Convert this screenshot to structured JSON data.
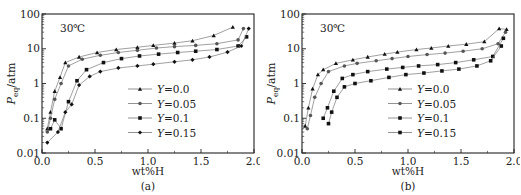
{
  "chart_data": [
    {
      "type": "line",
      "panel_label": "(a)",
      "title": "",
      "annotation": "30℃",
      "xlabel": "wt%H",
      "ylabel": "P_eq/atm",
      "ylabel_main": "P",
      "ylabel_sub": "eq",
      "ylabel_unit": "/atm",
      "yscale": "log",
      "xlim": [
        0.0,
        2.0
      ],
      "ylim": [
        0.01,
        100
      ],
      "xticks": [
        "0.0",
        "0.5",
        "1.0",
        "1.5",
        "2.0"
      ],
      "yticks": [
        "0.01",
        "0.1",
        "1",
        "10",
        "100"
      ],
      "grid": false,
      "legend_position": "center-right",
      "series": [
        {
          "name": "Y=0.0",
          "marker": "triangle",
          "x": [
            0.05,
            0.08,
            0.12,
            0.17,
            0.22,
            0.35,
            0.52,
            0.7,
            0.9,
            1.05,
            1.25,
            1.42,
            1.62,
            1.8
          ],
          "y": [
            0.05,
            0.15,
            0.6,
            1.5,
            4.0,
            5.8,
            7.8,
            9.5,
            11.0,
            12.5,
            14.5,
            17.0,
            24.0,
            42.0
          ]
        },
        {
          "name": "Y=0.05",
          "marker": "circle",
          "x": [
            0.05,
            0.08,
            0.12,
            0.18,
            0.25,
            0.38,
            0.55,
            0.72,
            0.9,
            1.08,
            1.25,
            1.45,
            1.65,
            1.85,
            1.9
          ],
          "y": [
            0.04,
            0.1,
            0.35,
            1.0,
            3.2,
            5.0,
            6.5,
            7.8,
            9.0,
            10.5,
            11.5,
            12.5,
            14.0,
            18.0,
            38.0
          ]
        },
        {
          "name": "Y=0.1",
          "marker": "square",
          "x": [
            0.08,
            0.12,
            0.18,
            0.25,
            0.33,
            0.42,
            0.58,
            0.75,
            0.92,
            1.1,
            1.28,
            1.45,
            1.65,
            1.85,
            1.93
          ],
          "y": [
            0.05,
            0.09,
            0.05,
            0.3,
            1.2,
            2.5,
            4.0,
            5.2,
            6.2,
            7.0,
            7.8,
            8.5,
            9.5,
            12.0,
            22.0
          ]
        },
        {
          "name": "Y=0.15",
          "marker": "diamond",
          "x": [
            0.05,
            0.15,
            0.22,
            0.28,
            0.35,
            0.45,
            0.55,
            0.72,
            0.9,
            1.05,
            1.25,
            1.42,
            1.58,
            1.75,
            1.88,
            1.95
          ],
          "y": [
            0.02,
            0.04,
            0.15,
            0.25,
            0.9,
            1.6,
            2.2,
            2.8,
            3.2,
            3.6,
            4.2,
            4.8,
            5.8,
            8.0,
            12.0,
            38.0
          ]
        }
      ]
    },
    {
      "type": "line",
      "panel_label": "(b)",
      "title": "",
      "annotation": "30℃",
      "xlabel": "wt%H",
      "ylabel": "P_eq/atm",
      "ylabel_main": "P",
      "ylabel_sub": "eq",
      "ylabel_unit": "/atm",
      "yscale": "log",
      "xlim": [
        0.0,
        2.0
      ],
      "ylim": [
        0.01,
        100
      ],
      "xticks": [
        "0.0",
        "0.5",
        "1.0",
        "1.5",
        "2.0"
      ],
      "yticks": [
        "0.01",
        "0.1",
        "1",
        "10",
        "100"
      ],
      "grid": false,
      "legend_position": "center-right",
      "series": [
        {
          "name": "Y=0.0",
          "marker": "triangle",
          "x": [
            0.03,
            0.06,
            0.1,
            0.15,
            0.2,
            0.32,
            0.48,
            0.62,
            0.78,
            0.9,
            1.08,
            1.22,
            1.38,
            1.55,
            1.72,
            1.86,
            1.93
          ],
          "y": [
            0.06,
            0.2,
            0.7,
            1.8,
            2.5,
            3.8,
            4.8,
            5.8,
            7.0,
            8.0,
            9.5,
            10.5,
            12.0,
            13.5,
            16.0,
            38.0,
            36.0
          ]
        },
        {
          "name": "Y=0.05",
          "marker": "circle",
          "x": [
            0.05,
            0.08,
            0.12,
            0.18,
            0.25,
            0.4,
            0.52,
            0.7,
            0.85,
            1.0,
            1.18,
            1.35,
            1.52,
            1.7,
            1.85,
            1.92
          ],
          "y": [
            0.05,
            0.12,
            0.4,
            1.0,
            2.2,
            3.2,
            3.8,
            4.5,
            5.2,
            6.0,
            6.8,
            7.5,
            8.5,
            10.0,
            14.0,
            30.0
          ]
        },
        {
          "name": "Y=0.1",
          "marker": "square",
          "x": [
            0.2,
            0.24,
            0.3,
            0.38,
            0.48,
            0.62,
            0.8,
            0.95,
            1.1,
            1.28,
            1.45,
            1.62,
            1.8,
            1.9
          ],
          "y": [
            0.1,
            0.2,
            0.6,
            1.4,
            1.8,
            2.2,
            2.6,
            2.9,
            3.2,
            3.5,
            4.0,
            4.8,
            6.0,
            20.0
          ]
        },
        {
          "name": "Y=0.15",
          "marker": "square",
          "x": [
            0.25,
            0.28,
            0.33,
            0.4,
            0.5,
            0.65,
            0.82,
            0.98,
            1.15,
            1.32,
            1.48,
            1.65,
            1.78,
            1.88
          ],
          "y": [
            0.07,
            0.15,
            0.4,
            0.8,
            1.0,
            1.2,
            1.5,
            1.8,
            2.0,
            2.3,
            2.6,
            3.2,
            4.5,
            12.0
          ]
        }
      ]
    }
  ],
  "figure": {
    "panel_a": {
      "label": "(a)",
      "annotation": "30℃",
      "xlabel": "wt%H",
      "ylabel_main": "P",
      "ylabel_sub": "eq",
      "ylabel_unit": "/atm",
      "legend": [
        "Y=0.0",
        "Y=0.05",
        "Y=0.1",
        "Y=0.15"
      ]
    },
    "panel_b": {
      "label": "(b)",
      "annotation": "30℃",
      "xlabel": "wt%H",
      "ylabel_main": "P",
      "ylabel_sub": "eq",
      "ylabel_unit": "/atm",
      "legend": [
        "Y=0.0",
        "Y=0.05",
        "Y=0.1",
        "Y=0.15"
      ]
    }
  }
}
